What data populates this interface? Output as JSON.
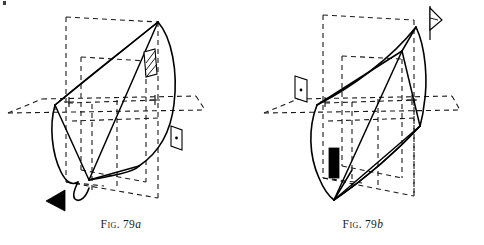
{
  "plate": {
    "width": 484,
    "height": 245,
    "background_color": "#ffffff",
    "ink_color": "#000000",
    "description": "Two line-drawing perspective figures of a curved surface panel bounded by dashed reference planes, labelled Fig. 79a and Fig. 79b"
  },
  "figures": [
    {
      "id": "figure-a",
      "caption_prefix": "Fig.",
      "caption_number": "79",
      "caption_suffix": "a",
      "caption_full": "Fig. 79a",
      "markers": [
        {
          "name": "hatched-vane-marker",
          "kind": "hatched-parallelogram",
          "x": 150,
          "y": 62
        },
        {
          "name": "dotted-flag-marker",
          "kind": "outlined-flag-with-dot",
          "x": 176,
          "y": 138
        },
        {
          "name": "solid-arrowhead-marker",
          "kind": "filled-triangle",
          "x": 55,
          "y": 201
        }
      ]
    },
    {
      "id": "figure-b",
      "caption_prefix": "Fig.",
      "caption_number": "79",
      "caption_suffix": "b",
      "caption_full": "Fig. 79b",
      "markers": [
        {
          "name": "pennant-flag-marker",
          "kind": "outlined-pennant",
          "x": 430,
          "y": 22
        },
        {
          "name": "dotted-flag-marker",
          "kind": "outlined-flag-with-dot",
          "x": 301,
          "y": 90
        },
        {
          "name": "solid-bar-marker",
          "kind": "filled-rectangle",
          "x": 334,
          "y": 163
        }
      ]
    }
  ],
  "style_tokens": {
    "dash_pattern": "5 4",
    "solid_stroke_width": "1.5",
    "dashed_stroke_width": "1.1",
    "curve_stroke_width": "1.6"
  }
}
